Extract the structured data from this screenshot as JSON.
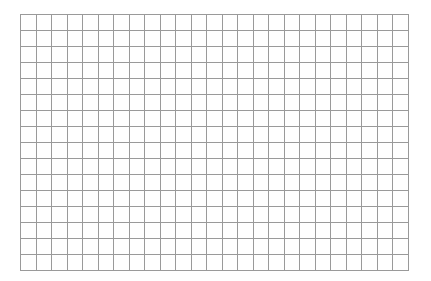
{
  "grid": {
    "columns": 25,
    "rows": 16,
    "left": 20,
    "top": 14,
    "width": 388,
    "height": 256,
    "line_color": "#9a9a9a",
    "background": "#ffffff"
  }
}
